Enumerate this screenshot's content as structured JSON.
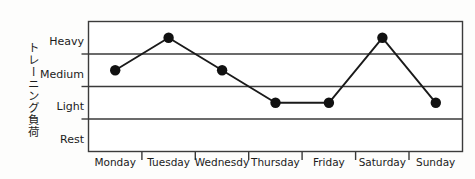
{
  "chart_data": {
    "type": "line",
    "title": "",
    "xlabel": "",
    "ylabel": "トレーニング負荷",
    "categories": [
      "Monday",
      "Tuesday",
      "Wednesdy",
      "Thursday",
      "Friday",
      "Saturday",
      "Sunday"
    ],
    "y_categories": [
      "Rest",
      "Light",
      "Medium",
      "Heavy"
    ],
    "values": [
      "Medium",
      "Heavy",
      "Medium",
      "Light",
      "Light",
      "Heavy",
      "Light"
    ],
    "numeric_values": [
      2,
      3,
      2,
      1,
      1,
      3,
      1
    ],
    "ylim": [
      0,
      4
    ],
    "grid": true,
    "legend": false,
    "marker": "filled-circle",
    "line_color": "#1a1a1a",
    "marker_color": "#111111",
    "grid_color": "#3a3a3a",
    "axis_color": "#333333",
    "background": "#fdfdfc",
    "series": [
      {
        "name": "training load",
        "values": [
          2,
          3,
          2,
          1,
          1,
          3,
          1
        ]
      }
    ],
    "points": [
      {
        "label": "Monday",
        "value": "Medium",
        "level": 2
      },
      {
        "label": "Tuesday",
        "value": "Heavy",
        "level": 3
      },
      {
        "label": "Wednesdy",
        "value": "Medium",
        "level": 2
      },
      {
        "label": "Thursday",
        "value": "Light",
        "level": 1
      },
      {
        "label": "Friday",
        "value": "Light",
        "level": 1
      },
      {
        "label": "Saturday",
        "value": "Heavy",
        "level": 3
      },
      {
        "label": "Sunday",
        "value": "Light",
        "level": 1
      }
    ]
  },
  "axis": {
    "y_labels": [
      "Heavy",
      "Medium",
      "Light",
      "Rest"
    ],
    "x_labels": [
      "Monday",
      "Tuesday",
      "Wednesdy",
      "Thursday",
      "Friday",
      "Saturday",
      "Sunday"
    ],
    "y_caption": "トレーニング負荷"
  }
}
